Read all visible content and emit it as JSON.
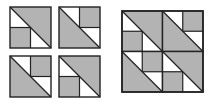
{
  "colors": {
    "fill": "#b3b3b3",
    "stroke": "#222222",
    "background": "#ffffff"
  },
  "small_tiles": [
    {
      "name": "tile-a",
      "pattern": "A",
      "x": 10,
      "y": 7,
      "size": 41
    },
    {
      "name": "tile-b",
      "pattern": "B",
      "x": 59,
      "y": 7,
      "size": 41
    },
    {
      "name": "tile-c",
      "pattern": "B",
      "x": 10,
      "y": 56,
      "size": 41
    },
    {
      "name": "tile-d",
      "pattern": "A",
      "x": 59,
      "y": 56,
      "size": 41
    }
  ],
  "big_block": {
    "x": 122,
    "y": 11,
    "size": 81,
    "tiles": [
      "A",
      "B",
      "B",
      "A"
    ]
  },
  "patterns": {
    "A": "upper-right triangle shaded, bottom-left quadrant shaded",
    "B": "lower-left triangle shaded, top-right quadrant shaded"
  }
}
